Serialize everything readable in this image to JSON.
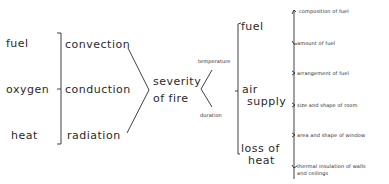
{
  "diagram": {
    "title": "",
    "column1": {
      "items": [
        "fuel",
        "oxygen",
        "heat"
      ]
    },
    "column2": {
      "items": [
        "convection",
        "conduction",
        "radiation"
      ]
    },
    "center": {
      "line1": "severity",
      "line2": "of fire"
    },
    "column3": {
      "items": [
        "temperature",
        "duration"
      ]
    },
    "column4": {
      "fuel": "fuel",
      "air_line1": "air",
      "air_line2": "supply",
      "loss_line1": "loss of",
      "loss_line2": "heat"
    },
    "column5": {
      "items": [
        "composition of fuel",
        "amount of fuel",
        "arrangement of fuel",
        "size and shape of room",
        "area and shape of window",
        "thermal insulation of walls",
        "and ceilings"
      ]
    },
    "line_color": "#2a2a2a"
  }
}
